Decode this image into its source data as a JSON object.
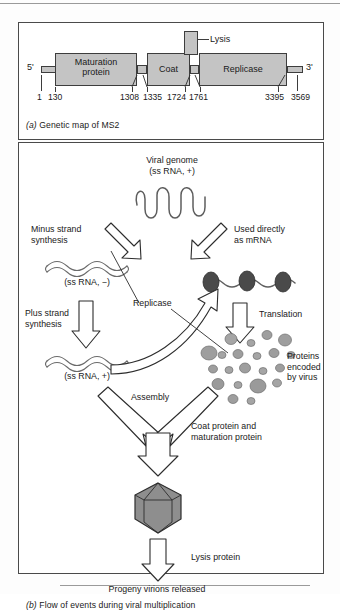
{
  "figure": {
    "panel_a": {
      "caption_tag": "(a)",
      "caption_text": "Genetic map of MS2",
      "five_prime": "5'",
      "three_prime": "3'",
      "genes": [
        {
          "name": "Maturation protein",
          "line1": "Maturation",
          "line2": "protein"
        },
        {
          "name": "Coat",
          "line1": "Coat",
          "line2": ""
        },
        {
          "name": "Replicase",
          "line1": "Replicase",
          "line2": ""
        },
        {
          "name": "Lysis",
          "line1": "Lysis",
          "line2": ""
        }
      ],
      "coordinates": [
        "1",
        "130",
        "1308",
        "1335",
        "1724",
        "1761",
        "3395",
        "3569"
      ]
    },
    "panel_b": {
      "caption_tag": "(b)",
      "caption_text": "Flow of events during viral multiplication",
      "genome_title_1": "Viral genome",
      "genome_title_2": "(ss RNA, +)",
      "minus_strand_1": "Minus strand",
      "minus_strand_2": "synthesis",
      "used_directly_1": "Used directly",
      "used_directly_2": "as mRNA",
      "ss_rna_minus": "(ss RNA, −)",
      "plus_strand_1": "Plus strand",
      "plus_strand_2": "synthesis",
      "ss_rna_plus": "(ss RNA, +)",
      "replicase": "Replicase",
      "translation": "Translation",
      "proteins_1": "Proteins",
      "proteins_2": "encoded",
      "proteins_3": "by virus",
      "assembly": "Assembly",
      "coat_protein_1": "Coat protein and",
      "coat_protein_2": "maturation protein",
      "lysis_protein": "Lysis protein",
      "progeny": "Progeny virions released"
    }
  },
  "colors": {
    "gene_fill": "#c4c4c4",
    "outline": "#3d3d3d",
    "ribosome": "#4f4f4f",
    "capsid": "#8c8c8c",
    "protein_blob": "#9a9a9a"
  }
}
